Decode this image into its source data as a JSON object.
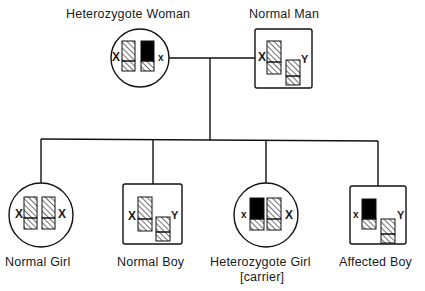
{
  "diagram": {
    "type": "X-linked inheritance pedigree",
    "colors": {
      "line": "#111111",
      "affected_fill": "#000000",
      "background": "#ffffff"
    },
    "legend": {
      "hatched": "normal chromosome segment",
      "solid_black": "affected X chromosome segment"
    },
    "parents": [
      {
        "id": "mother",
        "label": "Heterozygote Woman",
        "shape": "circle",
        "sex": "female",
        "chromosomes": [
          {
            "name": "X",
            "state": "normal",
            "label": "X"
          },
          {
            "name": "X",
            "state": "affected",
            "label": "x"
          }
        ]
      },
      {
        "id": "father",
        "label": "Normal Man",
        "shape": "square",
        "sex": "male",
        "chromosomes": [
          {
            "name": "X",
            "state": "normal",
            "label": "X"
          },
          {
            "name": "Y",
            "state": "normal",
            "label": "Y"
          }
        ]
      }
    ],
    "children": [
      {
        "id": "child1",
        "label": "Normal Girl",
        "sublabel": "",
        "shape": "circle",
        "sex": "female",
        "chromosomes": [
          {
            "name": "X",
            "state": "normal",
            "label": "X"
          },
          {
            "name": "X",
            "state": "normal",
            "label": "X"
          }
        ]
      },
      {
        "id": "child2",
        "label": "Normal Boy",
        "sublabel": "",
        "shape": "square",
        "sex": "male",
        "chromosomes": [
          {
            "name": "X",
            "state": "normal",
            "label": "X"
          },
          {
            "name": "Y",
            "state": "normal",
            "label": "Y"
          }
        ]
      },
      {
        "id": "child3",
        "label": "Heterozygote Girl",
        "sublabel": "[carrier]",
        "shape": "circle",
        "sex": "female",
        "chromosomes": [
          {
            "name": "X",
            "state": "affected",
            "label": "x"
          },
          {
            "name": "X",
            "state": "normal",
            "label": "X"
          }
        ]
      },
      {
        "id": "child4",
        "label": "Affected Boy",
        "sublabel": "",
        "shape": "square",
        "sex": "male",
        "chromosomes": [
          {
            "name": "X",
            "state": "affected",
            "label": "x"
          },
          {
            "name": "Y",
            "state": "normal",
            "label": "Y"
          }
        ]
      }
    ]
  },
  "labels": {
    "mother": "Heterozygote Woman",
    "father": "Normal Man",
    "child1": "Normal Girl",
    "child2": "Normal Boy",
    "child3": "Heterozygote Girl",
    "child3_sub": "[carrier]",
    "child4": "Affected Boy"
  },
  "chrom_letters": {
    "mother_left": "X",
    "mother_right": "x",
    "father_left": "X",
    "father_right": "Y",
    "child1_left": "X",
    "child1_right": "X",
    "child2_left": "X",
    "child2_right": "Y",
    "child3_left": "x",
    "child3_right": "X",
    "child4_left": "x",
    "child4_right": "Y"
  }
}
